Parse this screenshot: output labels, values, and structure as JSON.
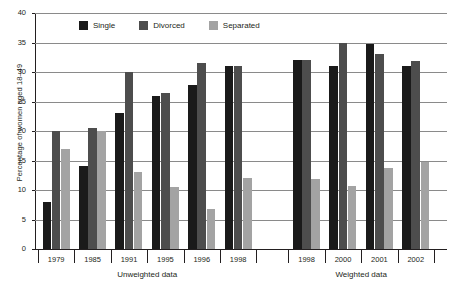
{
  "chart_data": {
    "type": "bar",
    "title": "",
    "xlabel": "",
    "ylabel": "Percentage of women aged 18–49",
    "ylim": [
      0,
      40
    ],
    "yticks": [
      0,
      5,
      10,
      15,
      20,
      25,
      30,
      35,
      40
    ],
    "grid": true,
    "legend_position": "top-left",
    "categories": [
      "1979",
      "1985",
      "1991",
      "1995",
      "1996",
      "1998",
      "1998",
      "2000",
      "2001",
      "2002"
    ],
    "panels": [
      {
        "label": "Unweighted data",
        "categories": [
          "1979",
          "1985",
          "1991",
          "1995",
          "1996",
          "1998"
        ]
      },
      {
        "label": "Weighted data",
        "categories": [
          "1998",
          "2000",
          "2001",
          "2002"
        ]
      }
    ],
    "series": [
      {
        "name": "Single",
        "color": "#1a1a1a",
        "values": [
          8.0,
          14.0,
          23.0,
          26.0,
          27.8,
          31.0,
          32.0,
          31.0,
          34.8,
          31.0
        ]
      },
      {
        "name": "Divorced",
        "color": "#4d4d4d",
        "values": [
          20.0,
          20.5,
          30.0,
          26.5,
          31.5,
          31.0,
          32.0,
          35.0,
          33.0,
          31.8
        ]
      },
      {
        "name": "Separated",
        "color": "#a3a3a3",
        "values": [
          17.0,
          20.0,
          13.0,
          10.5,
          6.8,
          12.0,
          11.8,
          10.6,
          13.8,
          14.7
        ]
      }
    ]
  },
  "legend": {
    "items": [
      {
        "label": "Single",
        "key": "single"
      },
      {
        "label": "Divorced",
        "key": "divorced"
      },
      {
        "label": "Separated",
        "key": "separated"
      }
    ]
  },
  "axis": {
    "y_label": "Percentage of women aged 18–49",
    "y_tick_labels": [
      "0",
      "5",
      "10",
      "15",
      "20",
      "25",
      "30",
      "35",
      "40"
    ]
  }
}
